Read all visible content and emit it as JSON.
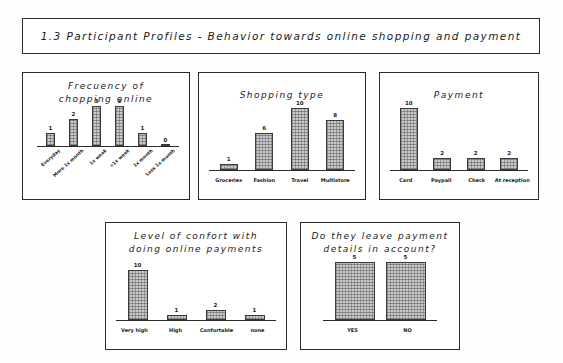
{
  "slide": {
    "title": "1.3 Participant Profiles - Behavior towards online shopping and payment"
  },
  "panels": [
    {
      "id": "frequency-of-shopping-online",
      "title_lines": [
        "Frecuency of",
        "chopping online"
      ]
    },
    {
      "id": "shopping-type",
      "title_lines": [
        "Shopping type"
      ]
    },
    {
      "id": "payment",
      "title_lines": [
        "Payment"
      ]
    },
    {
      "id": "level-of-comfort",
      "title_lines": [
        "Level of confort with",
        "doing online payments"
      ]
    },
    {
      "id": "leave-payment-details",
      "title_lines": [
        "Do they leave payment",
        "details in account?"
      ]
    }
  ],
  "chart_data": [
    {
      "type": "bar",
      "title": "Frecuency of chopping online",
      "categories": [
        "Everyday",
        "More 1x month",
        "1x week",
        "+1x week",
        "1x month",
        "Less 1x month"
      ],
      "values": [
        1,
        2,
        3,
        3,
        1,
        0
      ],
      "labels": [
        "1",
        "2",
        "3",
        "3",
        "1",
        "0"
      ],
      "xlabel": "",
      "ylabel": "",
      "ylim": [
        0,
        3
      ],
      "grid": false,
      "legend": "none",
      "xtick_rotation": -42
    },
    {
      "type": "bar",
      "title": "Shopping type",
      "categories": [
        "Groceries",
        "Fashion",
        "Travel",
        "Multistore"
      ],
      "values": [
        1,
        6,
        10,
        8
      ],
      "labels": [
        "1",
        "6",
        "10",
        "8"
      ],
      "xlabel": "",
      "ylabel": "",
      "ylim": [
        0,
        10
      ],
      "grid": false,
      "legend": "none",
      "xtick_rotation": 0
    },
    {
      "type": "bar",
      "title": "Payment",
      "categories": [
        "Card",
        "Paypall",
        "Check",
        "At reception"
      ],
      "values": [
        10,
        2,
        2,
        2
      ],
      "labels": [
        "10",
        "2",
        "2",
        "2"
      ],
      "xlabel": "",
      "ylabel": "",
      "ylim": [
        0,
        10
      ],
      "grid": false,
      "legend": "none",
      "xtick_rotation": 0
    },
    {
      "type": "bar",
      "title": "Level of confort with doing online payments",
      "categories": [
        "Very high",
        "High",
        "Confortable",
        "none"
      ],
      "values": [
        10,
        1,
        2,
        1
      ],
      "labels": [
        "10",
        "1",
        "2",
        "1"
      ],
      "xlabel": "",
      "ylabel": "",
      "ylim": [
        0,
        10
      ],
      "grid": false,
      "legend": "none",
      "xtick_rotation": 0
    },
    {
      "type": "bar",
      "title": "Do they leave payment details in account?",
      "categories": [
        "YES",
        "NO"
      ],
      "values": [
        5,
        5
      ],
      "labels": [
        "5",
        "5"
      ],
      "xlabel": "",
      "ylabel": "",
      "ylim": [
        0,
        5
      ],
      "grid": false,
      "legend": "none",
      "xtick_rotation": 0
    }
  ],
  "style": {
    "bar_fill": "#c9c9c9",
    "bar_stroke": "#3a3a3a",
    "ink": "#1a1a1a",
    "panel_border": "#2b2b2b",
    "background": "#fefefe"
  }
}
